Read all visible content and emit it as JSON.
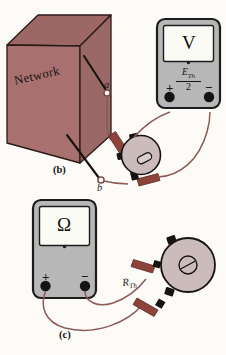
{
  "figure": {
    "caption_b": "(b)",
    "caption_c": "(c)",
    "background_color": "#fdfbf7"
  },
  "network_box": {
    "label": "Network",
    "face_color": "#a8716f",
    "top_color": "#9c6865",
    "side_color": "#9a6866",
    "edge_color": "#2a1a17"
  },
  "terminals": {
    "a_label": "a",
    "b_label": "b",
    "node_fill": "#ffffff",
    "node_stroke": "#7a4a44"
  },
  "voltmeter": {
    "display_symbol": "V",
    "reading_numerator": "E",
    "reading_numerator_sub": "Th",
    "reading_denominator": "2",
    "plus_label": "+",
    "minus_label": "−",
    "body_color": "#b7b7b7",
    "body_stroke": "#1c1c1c",
    "screen_color": "#fbfbf6",
    "terminal_color": "#141414"
  },
  "ohmmeter": {
    "display_symbol": "Ω",
    "plus_label": "+",
    "minus_label": "−",
    "body_color": "#b7b7b7",
    "body_stroke": "#1c1c1c",
    "screen_color": "#fbfbf6",
    "terminal_color": "#141414"
  },
  "potentiometer_b": {
    "body_color": "#cbbcbb",
    "body_stroke": "#171313",
    "lug_color": "#171313",
    "has_screw_slot": true
  },
  "potentiometer_c": {
    "label": "R",
    "label_sub": "Th",
    "body_color": "#cbbcbb",
    "body_stroke": "#171313",
    "lug_color": "#171313",
    "has_screw_slot": true
  },
  "wires": {
    "lead_color": "#8c5b58",
    "probe_color": "#8e433a",
    "probe_tip_color": "#171313"
  }
}
